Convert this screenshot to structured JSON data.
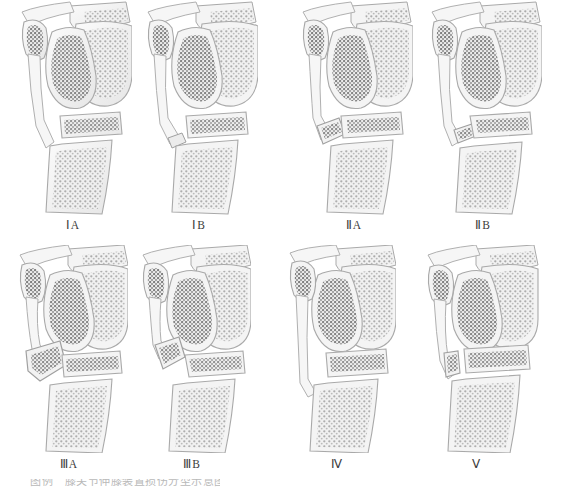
{
  "figure": {
    "background_color": "#ffffff",
    "ink_color": "#8d8d8d",
    "bone_fill": "#f2f2f2",
    "trabecula_color": "#9a9a9a",
    "patella_trabecula_color": "#6f6f6f",
    "outline_color": "#a9a9a9",
    "label_color": "#3c3c3c"
  },
  "rows": [
    {
      "name": "row-1",
      "panels": [
        {
          "id": "panel-1a",
          "label": "ⅠA",
          "variant": "tendon-intact-normal",
          "description": "Lateral knee: patella, femoral condyles, tibial plateau with continuous patellar tendon"
        },
        {
          "id": "panel-1b",
          "label": "ⅠB",
          "variant": "tendon-distal-avulsion",
          "description": "Patellar tendon detached at distal insertion, free blunt end"
        },
        {
          "id": "panel-2a",
          "label": "ⅡA",
          "variant": "small-bone-fragment",
          "description": "Small avulsed bone fragment at tibial tubercle with tendon"
        },
        {
          "id": "panel-2b",
          "label": "ⅡB",
          "variant": "small-bone-fragment-displaced",
          "description": "Small avulsed fragment displaced proximally with tendon"
        }
      ]
    },
    {
      "name": "row-2",
      "panels": [
        {
          "id": "panel-3a",
          "label": "ⅢA",
          "variant": "large-bone-fragment",
          "description": "Large avulsed tibial tubercle fragment attached to tendon"
        },
        {
          "id": "panel-3b",
          "label": "ⅢB",
          "variant": "large-bone-fragment-separated",
          "description": "Large fragment separated from tibial tubercle"
        },
        {
          "id": "panel-4",
          "label": "Ⅳ",
          "variant": "tendon-straight-no-fragment",
          "description": "Elongated straight tendon, no osseous fragment"
        },
        {
          "id": "panel-5",
          "label": "Ⅴ",
          "variant": "proximal-tibial-epiphysis",
          "description": "Tendon with proximal tibial epiphyseal involvement"
        }
      ]
    }
  ],
  "caption": {
    "text": "图例　膝关节伸膝装置损伤分型示意图",
    "clipped": true
  }
}
